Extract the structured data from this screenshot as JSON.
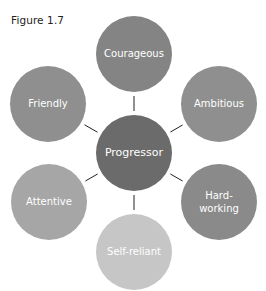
{
  "figure": {
    "label": "Figure 1.7"
  },
  "center": {
    "label": "Progressor",
    "color": "#6b6b6b",
    "cx": 134,
    "cy": 153,
    "r": 38
  },
  "nodes": [
    {
      "label": "Courageous",
      "lines": [
        "Courageous"
      ],
      "color": "#848484",
      "cx": 134,
      "cy": 54,
      "r": 38
    },
    {
      "label": "Ambitious",
      "lines": [
        "Ambitious"
      ],
      "color": "#8f8f8f",
      "cx": 219,
      "cy": 104,
      "r": 38
    },
    {
      "label": "Hard-working",
      "lines": [
        "Hard-",
        "working"
      ],
      "color": "#8a8a8a",
      "cx": 219,
      "cy": 202,
      "r": 38
    },
    {
      "label": "Self-reliant",
      "lines": [
        "Self-reliant"
      ],
      "color": "#c6c6c6",
      "cx": 134,
      "cy": 252,
      "r": 38
    },
    {
      "label": "Attentive",
      "lines": [
        "Attentive"
      ],
      "color": "#a6a6a6",
      "cx": 49,
      "cy": 202,
      "r": 38
    },
    {
      "label": "Friendly",
      "lines": [
        "Friendly"
      ],
      "color": "#8f8f8f",
      "cx": 48,
      "cy": 104,
      "r": 38
    }
  ]
}
